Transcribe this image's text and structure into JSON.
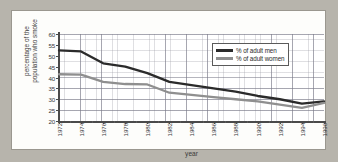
{
  "chart_data": {
    "type": "line",
    "title": "",
    "xlabel": "year",
    "ylabel": "percentage of the population who smoke",
    "ylabel_line1": "percentage of the",
    "ylabel_line2": "population who smoke",
    "xlim": [
      1972,
      1996
    ],
    "ylim": [
      20,
      60
    ],
    "yticks": [
      60,
      55,
      50,
      45,
      40,
      35,
      30,
      25,
      20
    ],
    "grid": true,
    "legend_position": "top-right",
    "categories": [
      1972,
      1974,
      1976,
      1978,
      1980,
      1982,
      1984,
      1986,
      1988,
      1990,
      1992,
      1994,
      1996
    ],
    "xtick_labels": [
      "1972",
      "1974",
      "1976",
      "1978",
      "1980",
      "1982",
      "1984",
      "1986",
      "1988",
      "1990",
      "1992",
      "1994",
      "1996"
    ],
    "series": [
      {
        "name": "% of adult men",
        "color": "#2b2b2b",
        "values": [
          52.5,
          52.0,
          46.5,
          45.0,
          42.0,
          38.0,
          36.5,
          35.0,
          33.5,
          31.5,
          30.0,
          28.0,
          29.0
        ]
      },
      {
        "name": "% of adult women",
        "color": "#8f8f8f",
        "values": [
          41.5,
          41.3,
          38.0,
          37.0,
          36.8,
          33.0,
          32.0,
          31.0,
          30.0,
          29.0,
          27.5,
          26.0,
          28.3
        ]
      }
    ]
  },
  "legend": {
    "items": [
      {
        "label": "% of adult men",
        "color": "#2b2b2b"
      },
      {
        "label": "% of adult women",
        "color": "#8f8f8f"
      }
    ]
  },
  "colors": {
    "page_background": "#b7b4ac",
    "panel_background": "#fdfdfb",
    "axis": "#4a4a4a",
    "grid_minor": "#9699a4",
    "grid_major": "#78788a",
    "men_line": "#2b2b2b",
    "women_line": "#8f8f8f"
  }
}
